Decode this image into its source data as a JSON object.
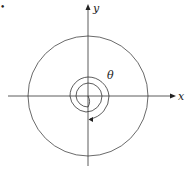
{
  "diagram": {
    "bullet": "•",
    "axes": {
      "x_label": "x",
      "y_label": "y"
    },
    "angle_label": "θ",
    "elements": [
      "x-axis",
      "y-axis",
      "outer-circle",
      "spiral",
      "angle-arrow"
    ],
    "colors": {
      "stroke": "#333333",
      "background": "#ffffff"
    }
  }
}
